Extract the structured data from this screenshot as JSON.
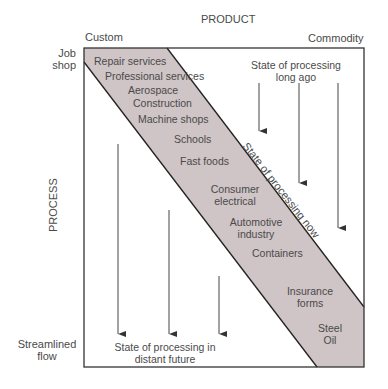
{
  "axes": {
    "product_title": "PRODUCT",
    "product_left": "Custom",
    "product_right": "Commodity",
    "process_title": "PROCESS",
    "process_top": [
      "Job",
      "shop"
    ],
    "process_bottom": [
      "Streamlined",
      "flow"
    ]
  },
  "band": {
    "fill": "#cfc4c6",
    "label": "State of processing now",
    "items": [
      "Repair services",
      "Professional services",
      "Aerospace",
      "Construction",
      "Machine shops",
      "Schools",
      "Fast foods",
      "Consumer",
      "electrical",
      "Automotive",
      "industry",
      "Containers",
      "Insurance",
      "forms",
      "Steel",
      "Oil"
    ]
  },
  "annotations": {
    "past": [
      "State of processing",
      "long ago"
    ],
    "future": [
      "State of processing in",
      "distant future"
    ]
  }
}
